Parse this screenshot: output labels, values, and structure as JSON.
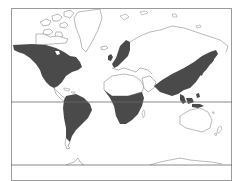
{
  "map": {
    "type": "world-map-mercator",
    "colors": {
      "background": "#ffffff",
      "frame": "#9a9a9a",
      "coastline": "#8a8a8a",
      "shaded_region": "#4a4a4a",
      "unshaded_land": "#ffffff"
    },
    "lines": {
      "equator": true,
      "bottom_boundary": true
    },
    "shaded_regions": [
      "north-america",
      "south-america",
      "northern-europe-scandinavia",
      "central-southern-africa",
      "east-asia",
      "southeast-asia",
      "indonesia"
    ],
    "unshaded_regions": [
      "greenland",
      "canadian-arctic-archipelago",
      "north-africa",
      "middle-east",
      "russia-siberia",
      "australia",
      "new-zealand",
      "antarctica"
    ]
  }
}
